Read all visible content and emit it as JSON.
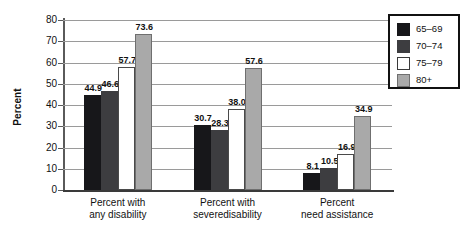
{
  "chart_data": {
    "type": "bar",
    "title": "",
    "xlabel": "",
    "ylabel": "Percent",
    "ylim": [
      0,
      80
    ],
    "ytick_step": 10,
    "yticks": [
      80,
      70,
      60,
      50,
      40,
      30,
      20,
      10,
      0
    ],
    "grid": true,
    "legend_position": "top-right",
    "categories": [
      "Percent with\nany disability",
      "Percent with\nseveredisability",
      "Percent\nneed assistance"
    ],
    "category_lines": [
      [
        "Percent with",
        "any disability"
      ],
      [
        "Percent with",
        "severedisability"
      ],
      [
        "Percent",
        "need assistance"
      ]
    ],
    "series": [
      {
        "name": "65–69",
        "color": "#17171a",
        "values": [
          44.9,
          30.7,
          8.1
        ]
      },
      {
        "name": "70–74",
        "color": "#3d3d40",
        "values": [
          46.6,
          28.3,
          10.5
        ]
      },
      {
        "name": "75–79",
        "color": "#ffffff",
        "values": [
          57.7,
          38.0,
          16.9
        ]
      },
      {
        "name": "80+",
        "color": "#a9a9a9",
        "values": [
          73.6,
          57.6,
          34.9
        ]
      }
    ],
    "value_labels": [
      [
        "44.9",
        "46.6",
        "57.7",
        "73.6"
      ],
      [
        "30.7",
        "28.3",
        "38.0",
        "57.6"
      ],
      [
        "8.1",
        "10.5",
        "16.9",
        "34.9"
      ]
    ]
  },
  "legend": {
    "items": [
      {
        "label": "65–69"
      },
      {
        "label": "70–74"
      },
      {
        "label": "75–79"
      },
      {
        "label": "80+"
      }
    ]
  }
}
